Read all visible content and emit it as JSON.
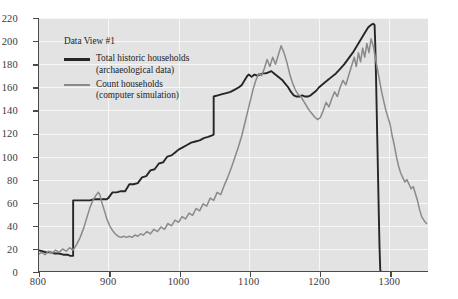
{
  "chart_data": {
    "type": "line",
    "title": "",
    "xlabel": "",
    "ylabel": "",
    "xlim": [
      800,
      1355
    ],
    "ylim": [
      0,
      220
    ],
    "grid": true,
    "legend_position": "upper-left",
    "legend_title": "Data View #1",
    "x_ticks": [
      800,
      900,
      1000,
      1100,
      1200,
      1300
    ],
    "y_ticks": [
      0,
      20,
      40,
      60,
      80,
      100,
      120,
      140,
      160,
      180,
      200,
      220
    ],
    "series": [
      {
        "name": "Total historic households",
        "sub": "(archaeological data)",
        "color": "#262629",
        "points": [
          [
            800,
            19
          ],
          [
            806,
            18
          ],
          [
            812,
            17
          ],
          [
            818,
            17
          ],
          [
            824,
            16
          ],
          [
            830,
            16
          ],
          [
            836,
            15
          ],
          [
            842,
            15
          ],
          [
            846,
            14
          ],
          [
            848,
            14
          ],
          [
            850,
            14
          ],
          [
            850,
            62
          ],
          [
            856,
            62
          ],
          [
            862,
            62
          ],
          [
            868,
            62
          ],
          [
            874,
            62
          ],
          [
            880,
            63
          ],
          [
            886,
            63
          ],
          [
            892,
            63
          ],
          [
            898,
            63
          ],
          [
            900,
            64
          ],
          [
            906,
            69
          ],
          [
            912,
            69
          ],
          [
            918,
            70
          ],
          [
            924,
            70
          ],
          [
            930,
            76
          ],
          [
            936,
            76
          ],
          [
            942,
            77
          ],
          [
            948,
            82
          ],
          [
            954,
            83
          ],
          [
            960,
            88
          ],
          [
            966,
            89
          ],
          [
            972,
            94
          ],
          [
            978,
            95
          ],
          [
            984,
            100
          ],
          [
            990,
            101
          ],
          [
            996,
            104
          ],
          [
            1000,
            106
          ],
          [
            1006,
            108
          ],
          [
            1012,
            110
          ],
          [
            1018,
            112
          ],
          [
            1024,
            113
          ],
          [
            1030,
            114
          ],
          [
            1036,
            116
          ],
          [
            1042,
            117
          ],
          [
            1046,
            118
          ],
          [
            1050,
            119
          ],
          [
            1050,
            152
          ],
          [
            1056,
            153
          ],
          [
            1062,
            154
          ],
          [
            1068,
            155
          ],
          [
            1074,
            156
          ],
          [
            1080,
            158
          ],
          [
            1086,
            160
          ],
          [
            1090,
            162
          ],
          [
            1094,
            166
          ],
          [
            1098,
            170
          ],
          [
            1100,
            171
          ],
          [
            1104,
            169
          ],
          [
            1108,
            171
          ],
          [
            1112,
            170
          ],
          [
            1116,
            171
          ],
          [
            1120,
            172
          ],
          [
            1124,
            172
          ],
          [
            1128,
            173
          ],
          [
            1132,
            174
          ],
          [
            1136,
            172
          ],
          [
            1140,
            170
          ],
          [
            1144,
            168
          ],
          [
            1148,
            166
          ],
          [
            1152,
            163
          ],
          [
            1156,
            160
          ],
          [
            1160,
            156
          ],
          [
            1164,
            153
          ],
          [
            1168,
            152
          ],
          [
            1172,
            152
          ],
          [
            1176,
            153
          ],
          [
            1180,
            152
          ],
          [
            1184,
            152
          ],
          [
            1188,
            153
          ],
          [
            1192,
            155
          ],
          [
            1196,
            157
          ],
          [
            1200,
            160
          ],
          [
            1206,
            163
          ],
          [
            1212,
            166
          ],
          [
            1218,
            169
          ],
          [
            1224,
            172
          ],
          [
            1230,
            176
          ],
          [
            1236,
            180
          ],
          [
            1242,
            185
          ],
          [
            1248,
            190
          ],
          [
            1254,
            196
          ],
          [
            1260,
            202
          ],
          [
            1266,
            208
          ],
          [
            1270,
            212
          ],
          [
            1274,
            214
          ],
          [
            1277,
            215
          ],
          [
            1279,
            214
          ],
          [
            1280,
            196
          ],
          [
            1281,
            170
          ],
          [
            1282,
            140
          ],
          [
            1283,
            110
          ],
          [
            1284,
            80
          ],
          [
            1285,
            50
          ],
          [
            1286,
            22
          ],
          [
            1287,
            2
          ],
          [
            1288,
            0
          ]
        ]
      },
      {
        "name": "Count households",
        "sub": "(computer simulation)",
        "color": "#8a8a8c",
        "points": [
          [
            800,
            15
          ],
          [
            805,
            17
          ],
          [
            810,
            15
          ],
          [
            815,
            18
          ],
          [
            820,
            16
          ],
          [
            825,
            19
          ],
          [
            830,
            17
          ],
          [
            835,
            20
          ],
          [
            840,
            18
          ],
          [
            845,
            21
          ],
          [
            850,
            19
          ],
          [
            855,
            24
          ],
          [
            860,
            30
          ],
          [
            865,
            38
          ],
          [
            870,
            48
          ],
          [
            874,
            56
          ],
          [
            878,
            62
          ],
          [
            882,
            66
          ],
          [
            886,
            69
          ],
          [
            888,
            67
          ],
          [
            890,
            62
          ],
          [
            894,
            54
          ],
          [
            898,
            46
          ],
          [
            902,
            40
          ],
          [
            906,
            36
          ],
          [
            910,
            33
          ],
          [
            914,
            31
          ],
          [
            918,
            30
          ],
          [
            922,
            31
          ],
          [
            926,
            30
          ],
          [
            930,
            31
          ],
          [
            934,
            30
          ],
          [
            938,
            32
          ],
          [
            942,
            31
          ],
          [
            946,
            33
          ],
          [
            950,
            32
          ],
          [
            955,
            35
          ],
          [
            960,
            33
          ],
          [
            965,
            37
          ],
          [
            970,
            35
          ],
          [
            975,
            39
          ],
          [
            980,
            37
          ],
          [
            985,
            42
          ],
          [
            990,
            40
          ],
          [
            995,
            45
          ],
          [
            1000,
            43
          ],
          [
            1005,
            48
          ],
          [
            1010,
            46
          ],
          [
            1015,
            51
          ],
          [
            1020,
            49
          ],
          [
            1025,
            55
          ],
          [
            1030,
            53
          ],
          [
            1035,
            59
          ],
          [
            1040,
            57
          ],
          [
            1045,
            64
          ],
          [
            1050,
            62
          ],
          [
            1055,
            69
          ],
          [
            1060,
            67
          ],
          [
            1065,
            75
          ],
          [
            1070,
            82
          ],
          [
            1075,
            90
          ],
          [
            1080,
            99
          ],
          [
            1085,
            108
          ],
          [
            1090,
            118
          ],
          [
            1094,
            128
          ],
          [
            1098,
            138
          ],
          [
            1102,
            148
          ],
          [
            1106,
            158
          ],
          [
            1110,
            166
          ],
          [
            1114,
            172
          ],
          [
            1118,
            170
          ],
          [
            1122,
            176
          ],
          [
            1126,
            184
          ],
          [
            1130,
            178
          ],
          [
            1134,
            186
          ],
          [
            1138,
            180
          ],
          [
            1142,
            188
          ],
          [
            1146,
            196
          ],
          [
            1150,
            190
          ],
          [
            1154,
            182
          ],
          [
            1158,
            172
          ],
          [
            1162,
            164
          ],
          [
            1166,
            158
          ],
          [
            1170,
            154
          ],
          [
            1174,
            152
          ],
          [
            1178,
            148
          ],
          [
            1182,
            144
          ],
          [
            1186,
            140
          ],
          [
            1190,
            137
          ],
          [
            1194,
            134
          ],
          [
            1198,
            132
          ],
          [
            1202,
            134
          ],
          [
            1206,
            140
          ],
          [
            1210,
            147
          ],
          [
            1214,
            143
          ],
          [
            1218,
            150
          ],
          [
            1222,
            156
          ],
          [
            1226,
            152
          ],
          [
            1230,
            160
          ],
          [
            1234,
            166
          ],
          [
            1238,
            162
          ],
          [
            1242,
            170
          ],
          [
            1246,
            178
          ],
          [
            1250,
            186
          ],
          [
            1253,
            178
          ],
          [
            1256,
            190
          ],
          [
            1259,
            182
          ],
          [
            1262,
            194
          ],
          [
            1265,
            186
          ],
          [
            1268,
            198
          ],
          [
            1271,
            190
          ],
          [
            1274,
            202
          ],
          [
            1277,
            196
          ],
          [
            1280,
            186
          ],
          [
            1283,
            176
          ],
          [
            1286,
            166
          ],
          [
            1289,
            156
          ],
          [
            1292,
            148
          ],
          [
            1295,
            140
          ],
          [
            1298,
            134
          ],
          [
            1301,
            128
          ],
          [
            1304,
            118
          ],
          [
            1307,
            110
          ],
          [
            1310,
            100
          ],
          [
            1313,
            92
          ],
          [
            1316,
            86
          ],
          [
            1319,
            82
          ],
          [
            1322,
            78
          ],
          [
            1325,
            80
          ],
          [
            1328,
            76
          ],
          [
            1331,
            72
          ],
          [
            1334,
            74
          ],
          [
            1337,
            68
          ],
          [
            1340,
            62
          ],
          [
            1343,
            54
          ],
          [
            1346,
            48
          ],
          [
            1350,
            44
          ],
          [
            1353,
            42
          ]
        ]
      }
    ]
  }
}
